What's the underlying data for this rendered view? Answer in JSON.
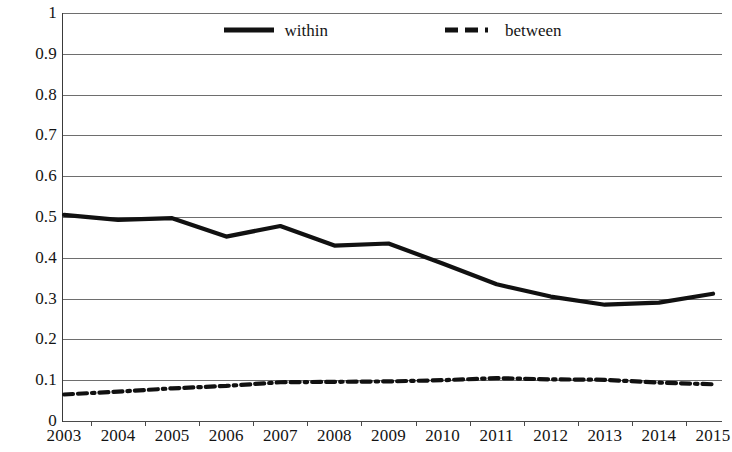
{
  "chart_data": {
    "type": "line",
    "title": "",
    "subtitle": "",
    "xlabel": "",
    "ylabel": "",
    "categories": [
      "2003",
      "2004",
      "2005",
      "2006",
      "2007",
      "2008",
      "2009",
      "2010",
      "2011",
      "2012",
      "2013",
      "2014",
      "2015"
    ],
    "x": [
      2003,
      2004,
      2005,
      2006,
      2007,
      2008,
      2009,
      2010,
      2011,
      2012,
      2013,
      2014,
      2015
    ],
    "ylim": [
      0,
      1
    ],
    "xlim": [
      2003,
      2015
    ],
    "y_ticks": [
      "0",
      "0.1",
      "0.2",
      "0.3",
      "0.4",
      "0.5",
      "0.6",
      "0.7",
      "0.8",
      "0.9",
      "1"
    ],
    "y_tick_values": [
      0,
      0.1,
      0.2,
      0.3,
      0.4,
      0.5,
      0.6,
      0.7,
      0.8,
      0.9,
      1
    ],
    "grid": true,
    "grid_axis": "y",
    "legend_position": "top-center",
    "series": [
      {
        "name": "within",
        "style": "solid",
        "color": "#111111",
        "width": 4,
        "values": [
          0.505,
          0.493,
          0.497,
          0.452,
          0.478,
          0.43,
          0.435,
          0.386,
          0.335,
          0.305,
          0.285,
          0.29,
          0.312
        ]
      },
      {
        "name": "between",
        "style": "dashed",
        "color": "#111111",
        "width": 4,
        "values": [
          0.065,
          0.072,
          0.08,
          0.086,
          0.095,
          0.096,
          0.097,
          0.1,
          0.105,
          0.102,
          0.101,
          0.094,
          0.09
        ]
      }
    ]
  },
  "legend": {
    "items": [
      {
        "label": "within",
        "swatch": "solid-line-swatch"
      },
      {
        "label": "between",
        "swatch": "dashed-line-swatch"
      }
    ]
  }
}
